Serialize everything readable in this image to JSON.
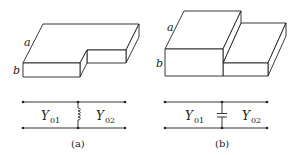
{
  "figure": {
    "panels": [
      {
        "id": "a",
        "caption": "(a)",
        "waveguide": {
          "type": "width-step (H-plane) rectangular waveguide",
          "dim_labels": {
            "wide": "a",
            "narrow": "b"
          }
        },
        "circuit": {
          "left_admittance": {
            "symbol": "Y",
            "subscript": "01"
          },
          "right_admittance": {
            "symbol": "Y",
            "subscript": "02"
          },
          "shunt_element": "inductor"
        }
      },
      {
        "id": "b",
        "caption": "(b)",
        "waveguide": {
          "type": "height-step (E-plane) rectangular waveguide",
          "dim_labels": {
            "wide": "a",
            "narrow": "b"
          }
        },
        "circuit": {
          "left_admittance": {
            "symbol": "Y",
            "subscript": "01"
          },
          "right_admittance": {
            "symbol": "Y",
            "subscript": "02"
          },
          "shunt_element": "capacitor"
        }
      }
    ]
  }
}
